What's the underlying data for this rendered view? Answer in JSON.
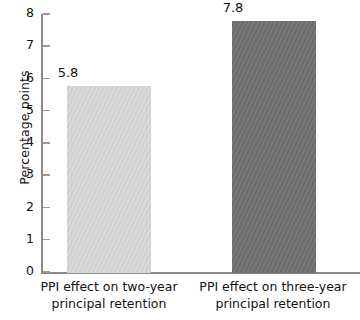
{
  "chart_data": {
    "type": "bar",
    "title": "",
    "subtitle": "",
    "xlabel": "",
    "ylabel": "Percentage points",
    "categories": [
      "PPI effect on two-year principal retention",
      "PPI effect on three-year principal retention"
    ],
    "category_lines": [
      [
        "PPI effect on two-year",
        "principal retention"
      ],
      [
        "PPI effect on three-year",
        "principal retention"
      ]
    ],
    "values": [
      5.8,
      7.8
    ],
    "value_labels": [
      "5.8",
      "7.8"
    ],
    "ylim": [
      0,
      8
    ],
    "yticks": [
      0,
      1,
      2,
      3,
      4,
      5,
      6,
      7,
      8
    ],
    "ytick_labels": [
      "0",
      "1",
      "2",
      "3",
      "4",
      "5",
      "6",
      "7",
      "8"
    ],
    "grid": false,
    "legend": false,
    "legend_position": "none",
    "bar_colors": [
      "#d9d9d9",
      "#6e6e6e"
    ],
    "axis_color": "#8a8a8a"
  }
}
